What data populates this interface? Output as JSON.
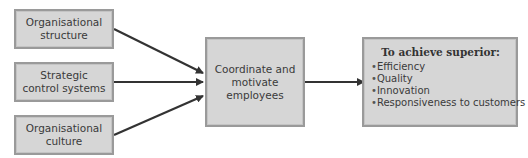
{
  "diagram": {
    "inputs": [
      {
        "id": "organisational-structure",
        "lines": [
          "Organisational",
          "structure"
        ]
      },
      {
        "id": "strategic-control-systems",
        "lines": [
          "Strategic",
          "control systems"
        ]
      },
      {
        "id": "organisational-culture",
        "lines": [
          "Organisational",
          "culture"
        ]
      }
    ],
    "center": {
      "lines": [
        "Coordinate and",
        "motivate",
        "employees"
      ]
    },
    "outcome": {
      "title": "To achieve superior:",
      "items": [
        "Efficiency",
        "Quality",
        "Innovation",
        "Responsiveness to customers"
      ]
    },
    "edges": [
      {
        "from": "organisational-structure",
        "to": "center"
      },
      {
        "from": "strategic-control-systems",
        "to": "center"
      },
      {
        "from": "organisational-culture",
        "to": "center"
      },
      {
        "from": "center",
        "to": "outcome"
      }
    ],
    "colors": {
      "box_fill": "#d6d6d6",
      "box_border": "#9a9a9a",
      "arrow": "#333333",
      "text": "#3a3a3a"
    }
  }
}
